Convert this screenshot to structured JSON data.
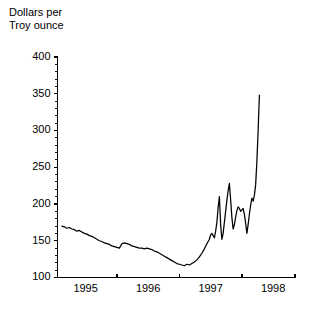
{
  "chart_data": {
    "type": "line",
    "title": "",
    "ylabel": "Dollars per\nTroy ounce",
    "ylabel_lines": [
      "Dollars per",
      "Troy ounce"
    ],
    "xlabel": "",
    "ylim": [
      100,
      400
    ],
    "xlim": [
      1994.55,
      1998.35
    ],
    "ytick_labels": [
      "100",
      "150",
      "200",
      "250",
      "300",
      "350",
      "400"
    ],
    "ytick_values": [
      100,
      150,
      200,
      250,
      300,
      350,
      400
    ],
    "yminor_step": 10,
    "xtick_labels": [
      "1995",
      "1996",
      "1997",
      "1998"
    ],
    "xtick_values": [
      1995,
      1996,
      1997,
      1998
    ],
    "xtick_mark_values": [
      1994.55,
      1995.5,
      1996.5,
      1997.5,
      1998.35
    ],
    "grid": false,
    "legend": null,
    "line_color": "#000000",
    "series": [
      {
        "name": "Gold price",
        "x": [
          1994.62,
          1994.66,
          1994.7,
          1994.74,
          1994.78,
          1994.82,
          1994.86,
          1994.9,
          1994.94,
          1994.98,
          1995.02,
          1995.06,
          1995.1,
          1995.14,
          1995.18,
          1995.22,
          1995.26,
          1995.3,
          1995.34,
          1995.38,
          1995.42,
          1995.46,
          1995.5,
          1995.54,
          1995.58,
          1995.62,
          1995.66,
          1995.7,
          1995.74,
          1995.78,
          1995.82,
          1995.86,
          1995.9,
          1995.94,
          1995.98,
          1996.02,
          1996.06,
          1996.1,
          1996.14,
          1996.18,
          1996.22,
          1996.26,
          1996.3,
          1996.34,
          1996.38,
          1996.42,
          1996.46,
          1996.5,
          1996.54,
          1996.58,
          1996.62,
          1996.66,
          1996.7,
          1996.74,
          1996.78,
          1996.82,
          1996.86,
          1996.9,
          1996.94,
          1996.98,
          1997.0,
          1997.02,
          1997.04,
          1997.06,
          1997.08,
          1997.1,
          1997.12,
          1997.14,
          1997.16,
          1997.18,
          1997.2,
          1997.22,
          1997.24,
          1997.26,
          1997.28,
          1997.3,
          1997.32,
          1997.34,
          1997.36,
          1997.38,
          1997.4,
          1997.42,
          1997.44,
          1997.46,
          1997.48,
          1997.5,
          1997.52,
          1997.54,
          1997.56,
          1997.58,
          1997.6,
          1997.62,
          1997.64,
          1997.66,
          1997.68,
          1997.7,
          1997.72,
          1997.74,
          1997.76,
          1997.78
        ],
        "y": [
          170,
          169,
          167,
          168,
          166,
          165,
          163,
          164,
          162,
          160,
          159,
          157,
          156,
          154,
          152,
          150,
          149,
          147,
          146,
          145,
          143,
          142,
          141,
          140,
          146,
          147,
          146,
          145,
          143,
          142,
          141,
          140,
          140,
          139,
          140,
          139,
          138,
          136,
          135,
          133,
          131,
          129,
          127,
          125,
          123,
          121,
          119,
          118,
          117,
          116,
          118,
          117,
          119,
          121,
          124,
          128,
          133,
          139,
          146,
          152,
          158,
          160,
          157,
          154,
          163,
          175,
          195,
          210,
          172,
          152,
          160,
          175,
          190,
          205,
          218,
          228,
          206,
          182,
          166,
          172,
          182,
          191,
          196,
          194,
          190,
          192,
          194,
          186,
          174,
          160,
          172,
          186,
          198,
          208,
          204,
          212,
          226,
          258,
          300,
          348
        ]
      }
    ],
    "annotations": []
  },
  "figure": {
    "background_color": "#ffffff",
    "width": 315,
    "height": 309
  }
}
